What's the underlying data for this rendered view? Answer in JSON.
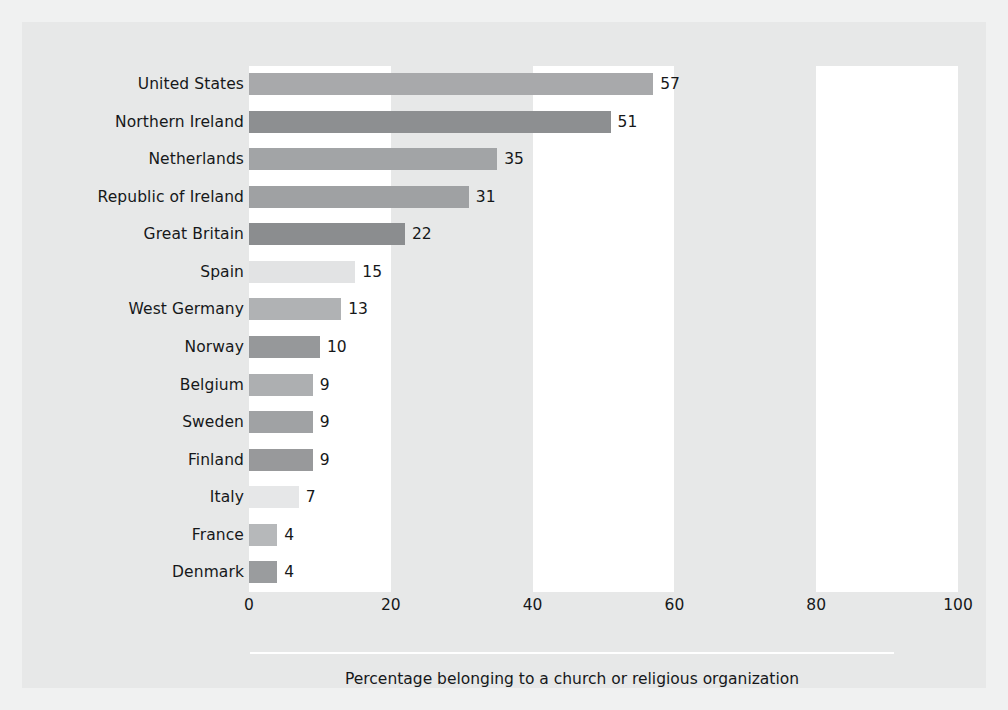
{
  "chart_data": {
    "type": "bar",
    "orientation": "horizontal",
    "title": "",
    "subtitle": "",
    "xlabel": "Percentage belonging to a church or religious organization",
    "ylabel": "",
    "xlim": [
      0,
      100
    ],
    "xticks": [
      0,
      20,
      40,
      60,
      80,
      100
    ],
    "xtick_labels": [
      "0",
      "20",
      "40",
      "60",
      "80",
      "100"
    ],
    "grid": false,
    "legend": null,
    "categories": [
      "United States",
      "Northern Ireland",
      "Netherlands",
      "Republic of Ireland",
      "Great Britain",
      "Spain",
      "West Germany",
      "Norway",
      "Belgium",
      "Sweden",
      "Finland",
      "Italy",
      "France",
      "Denmark"
    ],
    "values": [
      57,
      51,
      35,
      31,
      22,
      15,
      13,
      10,
      9,
      9,
      9,
      7,
      4,
      4
    ],
    "value_labels": [
      "57",
      "51",
      "35",
      "31",
      "22",
      "15",
      "13",
      "10",
      "9",
      "9",
      "9",
      "7",
      "4",
      "4"
    ],
    "bar_colors": [
      "#a8a9ab",
      "#8d8f91",
      "#a2a4a6",
      "#9fa1a3",
      "#8b8d8f",
      "#e2e3e4",
      "#b0b2b4",
      "#96989a",
      "#adafb1",
      "#a0a2a4",
      "#98999b",
      "#e6e7e8",
      "#b6b8ba",
      "#9a9c9e"
    ],
    "band_color": "#ffffff",
    "plot_background": "#e7e8e8",
    "bands": [
      {
        "from": 0,
        "to": 20
      },
      {
        "from": 40,
        "to": 60
      },
      {
        "from": 80,
        "to": 100
      }
    ]
  },
  "caption": {
    "text": "Percentage belonging to a church or religious organization"
  },
  "colors": {
    "figure_background": "#f0f1f1",
    "panel_background": "#e7e8e8",
    "text": "#16181a",
    "rule": "#ffffff"
  }
}
